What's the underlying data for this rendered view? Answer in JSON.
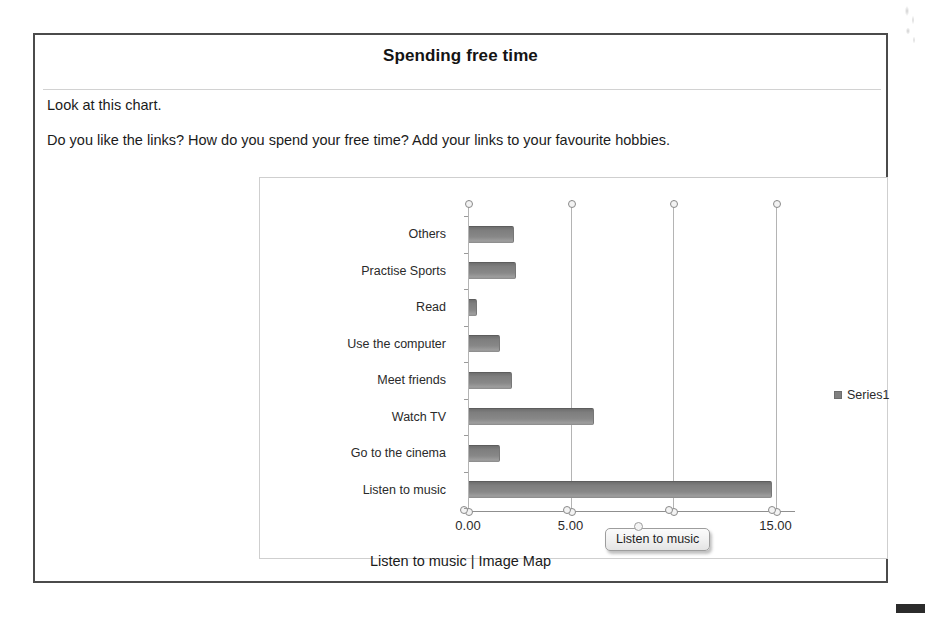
{
  "header": {
    "title": "Spending free time"
  },
  "instructions": [
    "Look at this chart.",
    "Do you like the links? How do you spend your free time? Add your links to your favourite hobbies."
  ],
  "footer": {
    "caption": "Listen to music | Image Map"
  },
  "tooltip": {
    "label": "Listen to music"
  },
  "legend": {
    "position": "right",
    "entries": [
      {
        "label": "Series1",
        "color": "#808080"
      }
    ]
  },
  "colors": {
    "bar": "#808080",
    "gridline": "#b4b4b4",
    "axis": "#8f8f8f",
    "frame": "#4b4b4b",
    "chart_frame": "#cfcfcf"
  },
  "chart_data": {
    "type": "bar",
    "orientation": "horizontal",
    "title": "Spending free time",
    "xlabel": "",
    "ylabel": "",
    "grid": true,
    "xlim": [
      0,
      15.9
    ],
    "xticks": [
      0,
      5,
      10,
      15
    ],
    "xtick_labels": [
      "0.00",
      "5.00",
      "10.00",
      "15.00"
    ],
    "xtick_label_hidden": [
      "10.00"
    ],
    "categories": [
      "Others",
      "Practise Sports",
      "Read",
      "Use the computer",
      "Meet friends",
      "Watch TV",
      "Go to the cinema",
      "Listen to music"
    ],
    "series": [
      {
        "name": "Series1",
        "values": [
          2.2,
          2.3,
          0.4,
          1.5,
          2.1,
          6.1,
          1.5,
          14.8
        ]
      }
    ]
  }
}
